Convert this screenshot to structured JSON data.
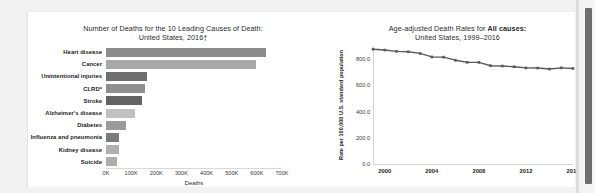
{
  "document": {
    "background_color": "#f2f2f2",
    "card_color": "#ffffff"
  },
  "scrollbar": {
    "name": "vertical-scrollbar",
    "thumb_color": "#6e6e6e"
  },
  "chart_data": [
    {
      "id": "leading-causes-of-death",
      "type": "bar",
      "orientation": "horizontal",
      "title_line1": "Number of Deaths for the 10 Leading Causes of Death:",
      "title_line2": "United States, 2016†",
      "xlabel": "Deaths",
      "ylabel": "",
      "xlim": [
        0,
        700000
      ],
      "grid": false,
      "legend": "none",
      "xtick_labels": [
        "0K",
        "100K",
        "200K",
        "300K",
        "400K",
        "500K",
        "600K",
        "700K"
      ],
      "xtick_values": [
        0,
        100000,
        200000,
        300000,
        400000,
        500000,
        600000,
        700000
      ],
      "categories": [
        "Heart disease",
        "Cancer",
        "Unintentional injuries",
        "CLRD*",
        "Stroke",
        "Alzheimer's disease",
        "Diabetes",
        "Influenza and pneumonia",
        "Kidney disease",
        "Suicide"
      ],
      "values": [
        635260,
        598038,
        161374,
        154596,
        142142,
        116103,
        80058,
        51537,
        50046,
        44965
      ],
      "bar_colors": [
        "#8c8c8c",
        "#a8a8a8",
        "#6f6f6f",
        "#8f8f8f",
        "#636363",
        "#c1c1c1",
        "#9a9a9a",
        "#7b7b7b",
        "#b0b0b0",
        "#aeaeae"
      ]
    },
    {
      "id": "age-adjusted-death-rates-all-causes",
      "type": "line",
      "title_prefix": "Age-adjusted Death Rates for ",
      "title_bold": "All causes:",
      "title_line2": "United States, 1999–2016",
      "xlabel": "",
      "ylabel": "Rate per 100,000 U.S. standard population",
      "ylim": [
        0,
        900
      ],
      "xlim": [
        1999,
        2016
      ],
      "grid": false,
      "legend": "none",
      "line_color": "#595959",
      "marker": "square",
      "ytick_labels": [
        "0.0",
        "200.0",
        "400.0",
        "600.0",
        "800.0"
      ],
      "ytick_values": [
        0,
        200,
        400,
        600,
        800
      ],
      "xtick_labels": [
        "2000",
        "2004",
        "2008",
        "2012",
        "2016"
      ],
      "xtick_values": [
        2000,
        2004,
        2008,
        2012,
        2016
      ],
      "x": [
        1999,
        2000,
        2001,
        2002,
        2003,
        2004,
        2005,
        2006,
        2007,
        2008,
        2009,
        2010,
        2011,
        2012,
        2013,
        2014,
        2015,
        2016
      ],
      "values": [
        875.6,
        869.0,
        858.8,
        855.9,
        843.3,
        816.5,
        815.0,
        791.8,
        775.3,
        774.9,
        749.6,
        747.0,
        741.3,
        732.8,
        731.9,
        724.6,
        733.1,
        728.8
      ]
    }
  ]
}
